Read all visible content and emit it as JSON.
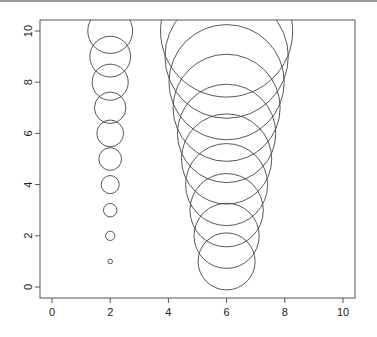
{
  "chart_data": {
    "type": "scatter",
    "title": "",
    "xlabel": "",
    "ylabel": "",
    "xlim": [
      -0.4,
      10.4
    ],
    "ylim": [
      -0.4,
      10.4
    ],
    "grid": false,
    "legend": "none",
    "x_ticks": [
      "0",
      "2",
      "4",
      "6",
      "8",
      "10"
    ],
    "y_ticks": [
      "0",
      "2",
      "4",
      "6",
      "8",
      "10"
    ],
    "marker": "open-circle",
    "series": [
      {
        "name": "left-column",
        "x": [
          2,
          2,
          2,
          2,
          2,
          2,
          2,
          2,
          2,
          2
        ],
        "y": [
          1,
          2,
          3,
          4,
          5,
          6,
          7,
          8,
          9,
          10
        ],
        "radius_x_units": [
          0.08,
          0.16,
          0.23,
          0.31,
          0.39,
          0.46,
          0.54,
          0.62,
          0.7,
          0.77
        ]
      },
      {
        "name": "right-column",
        "x": [
          6,
          6,
          6,
          6,
          6,
          6,
          6,
          6,
          6,
          6
        ],
        "y": [
          1,
          2,
          3,
          4,
          5,
          6,
          7,
          8,
          9,
          10
        ],
        "radius_x_units": [
          0.98,
          1.12,
          1.26,
          1.41,
          1.55,
          1.69,
          1.84,
          1.98,
          2.12,
          2.27
        ]
      }
    ]
  }
}
